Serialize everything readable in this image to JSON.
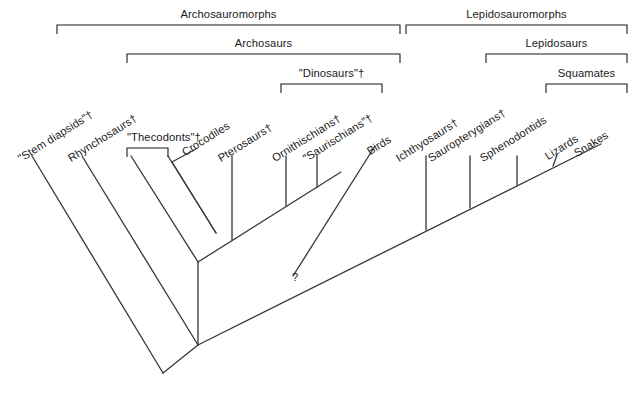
{
  "figure": {
    "type": "cladogram",
    "background_color": "#ffffff",
    "line_color": "#3b3b3b",
    "text_color": "#1a1a1a",
    "width": 636,
    "height": 412
  },
  "clade_brackets": [
    {
      "id": "archosauromorphs",
      "label": "Archosauromorphs",
      "x1": 57,
      "x2": 400,
      "y": 25,
      "label_y": 8
    },
    {
      "id": "lepidosauromorphs",
      "label": "Lepidosauromorphs",
      "x1": 406,
      "x2": 627,
      "y": 25,
      "label_y": 8
    },
    {
      "id": "archosaurs",
      "label": "Archosaurs",
      "x1": 127,
      "x2": 400,
      "y": 54,
      "label_y": 37
    },
    {
      "id": "lepidosaurs",
      "label": "Lepidosaurs",
      "x1": 486,
      "x2": 627,
      "y": 54,
      "label_y": 37
    },
    {
      "id": "dinosaurs",
      "label": "\"Dinosaurs\"†",
      "x1": 281,
      "x2": 382,
      "y": 84,
      "label_y": 67
    },
    {
      "id": "squamates",
      "label": "Squamates",
      "x1": 546,
      "x2": 627,
      "y": 84,
      "label_y": 67
    },
    {
      "id": "thecodonts",
      "label": "\"Thecodonts\"†",
      "x1": 127,
      "x2": 168,
      "y": 148,
      "label_y": 131
    }
  ],
  "taxa": [
    {
      "id": "stem-diapsids",
      "label": "\"Stem diapsids\"†",
      "tip_x": 32,
      "tip_y": 156,
      "label_x": 22,
      "label_y": 152
    },
    {
      "id": "rhynchosaurs",
      "label": "Rhynchosaurs†",
      "tip_x": 82,
      "tip_y": 156,
      "label_x": 72,
      "label_y": 152
    },
    {
      "id": "thecodonts-a",
      "label": "",
      "tip_x": 131,
      "tip_y": 156,
      "label_x": 0,
      "label_y": 0
    },
    {
      "id": "thecodonts-b",
      "label": "",
      "tip_x": 168,
      "tip_y": 156,
      "label_x": 0,
      "label_y": 0
    },
    {
      "id": "crocodiles",
      "label": "Crocodiles",
      "tip_x": 196,
      "tip_y": 148,
      "label_x": 186,
      "label_y": 146
    },
    {
      "id": "pterosaurs",
      "label": "Pterosaurs†",
      "tip_x": 232,
      "tip_y": 156,
      "label_x": 222,
      "label_y": 152
    },
    {
      "id": "ornithischians",
      "label": "Ornithischians†",
      "tip_x": 286,
      "tip_y": 156,
      "label_x": 276,
      "label_y": 152
    },
    {
      "id": "saurischians",
      "label": "\"Saurischians\"†",
      "tip_x": 317,
      "tip_y": 156,
      "label_x": 307,
      "label_y": 152
    },
    {
      "id": "birds",
      "label": "Birds",
      "tip_x": 374,
      "tip_y": 146,
      "label_x": 371,
      "label_y": 145
    },
    {
      "id": "ichthyosaurs",
      "label": "Ichthyosaurs†",
      "tip_x": 426,
      "tip_y": 156,
      "label_x": 400,
      "label_y": 152
    },
    {
      "id": "sauropterygians",
      "label": "Sauropterygians†",
      "tip_x": 470,
      "tip_y": 156,
      "label_x": 432,
      "label_y": 152
    },
    {
      "id": "sphenodontids",
      "label": "Sphenodontids",
      "tip_x": 517,
      "tip_y": 156,
      "label_x": 484,
      "label_y": 152
    },
    {
      "id": "lizards",
      "label": "Lizards",
      "tip_x": 557,
      "tip_y": 156,
      "label_x": 549,
      "label_y": 150
    },
    {
      "id": "snakes",
      "label": "Snakes",
      "tip_x": 600,
      "tip_y": 144,
      "label_x": 578,
      "label_y": 147
    }
  ],
  "annotations": [
    {
      "id": "uncertain-bird-origin",
      "label": "?",
      "x": 292,
      "y": 271
    }
  ],
  "tree_lines": {
    "description": "Angled-ladder cladogram. Terminal branches drop from tips to a series of nested V-shaped internal nodes.",
    "root_node": {
      "x": 163,
      "y": 373
    },
    "segments": [
      {
        "from": [
          32,
          156
        ],
        "to": [
          163,
          373
        ],
        "kind": "terminal-diagonal"
      },
      {
        "from": [
          82,
          156
        ],
        "to": [
          197,
          345
        ],
        "kind": "terminal-diagonal"
      },
      {
        "from": [
          131,
          156
        ],
        "to": [
          197,
          262
        ],
        "kind": "terminal-diagonal"
      },
      {
        "from": [
          168,
          156
        ],
        "to": [
          215,
          235
        ],
        "kind": "terminal-diagonal"
      },
      {
        "from": [
          196,
          148
        ],
        "to": [
          168,
          160
        ],
        "kind": "crocodile-link"
      },
      {
        "from": [
          232,
          156
        ],
        "to": [
          232,
          208
        ],
        "kind": "terminal-vertical"
      },
      {
        "from": [
          286,
          156
        ],
        "to": [
          286,
          190
        ],
        "kind": "terminal-vertical"
      },
      {
        "from": [
          317,
          156
        ],
        "to": [
          317,
          183
        ],
        "kind": "terminal-vertical"
      },
      {
        "from": [
          374,
          146
        ],
        "to": [
          292,
          276
        ],
        "kind": "bird-diagonal"
      },
      {
        "from": [
          426,
          156
        ],
        "to": [
          426,
          186
        ],
        "kind": "terminal-vertical"
      },
      {
        "from": [
          470,
          156
        ],
        "to": [
          470,
          207
        ],
        "kind": "terminal-vertical"
      },
      {
        "from": [
          517,
          156
        ],
        "to": [
          517,
          184
        ],
        "kind": "terminal-vertical"
      },
      {
        "from": [
          557,
          156
        ],
        "to": [
          553,
          165
        ],
        "kind": "terminal-stub"
      },
      {
        "from": [
          600,
          144
        ],
        "to": [
          197,
          345
        ],
        "kind": "spine-right"
      },
      {
        "from": [
          197,
          262
        ],
        "to": [
          340,
          172
        ],
        "kind": "spine-archosaur"
      },
      {
        "from": [
          163,
          373
        ],
        "to": [
          197,
          345
        ],
        "kind": "root-left"
      }
    ]
  }
}
